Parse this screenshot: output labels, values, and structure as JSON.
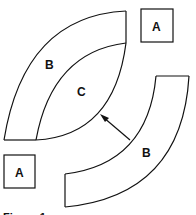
{
  "diagram": {
    "labels": {
      "box_top": "A",
      "box_bottom": "A",
      "band_left": "B",
      "lens": "C",
      "band_right": "B"
    },
    "caption": "Figure 1",
    "colors": {
      "stroke": "#111111",
      "background": "#ffffff"
    }
  }
}
